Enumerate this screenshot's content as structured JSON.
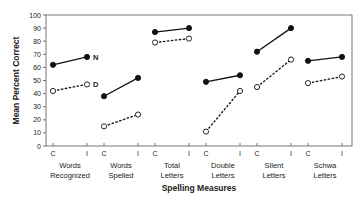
{
  "chart_data": {
    "type": "line",
    "title": "",
    "xlabel": "Spelling Measures",
    "ylabel": "Mean Percent Correct",
    "ylim": [
      0,
      100
    ],
    "yticks": [
      0,
      10,
      20,
      30,
      40,
      50,
      60,
      70,
      80,
      90,
      100
    ],
    "grid": false,
    "legend_position": "inline labels next to first group (N, D)",
    "groups": [
      "Words Recognized",
      "Words Spelled",
      "Total Letters",
      "Double Letters",
      "Silent Letters",
      "Schwa Letters"
    ],
    "group_labels": [
      [
        "Words",
        "Recognized"
      ],
      [
        "Words",
        "Spelled"
      ],
      [
        "Total",
        "Letters"
      ],
      [
        "Double",
        "Letters"
      ],
      [
        "Silent",
        "Letters"
      ],
      [
        "Schwa",
        "Letters"
      ]
    ],
    "conditions": [
      "C",
      "I"
    ],
    "series": [
      {
        "name": "N",
        "marker": "filled-circle",
        "line": "solid",
        "values": [
          [
            62,
            68
          ],
          [
            38,
            52
          ],
          [
            87,
            90
          ],
          [
            49,
            54
          ],
          [
            72,
            90
          ],
          [
            65,
            68
          ]
        ]
      },
      {
        "name": "D",
        "marker": "open-circle",
        "line": "dashed",
        "values": [
          [
            42,
            47
          ],
          [
            15,
            24
          ],
          [
            79,
            82
          ],
          [
            11,
            42
          ],
          [
            45,
            66
          ],
          [
            48,
            53
          ]
        ]
      }
    ]
  }
}
